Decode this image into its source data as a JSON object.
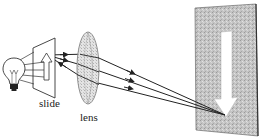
{
  "diagram": {
    "labels": {
      "slide": "slide",
      "lens": "lens"
    },
    "components": [
      {
        "name": "light-bulb",
        "icon": "light-bulb-icon"
      },
      {
        "name": "slide",
        "content": "upright arrow"
      },
      {
        "name": "lens",
        "type": "convex lens"
      },
      {
        "name": "screen",
        "content": "inverted arrow image"
      }
    ],
    "rays": {
      "count": 3,
      "from": "slide arrow tip",
      "through": "lens",
      "to": "screen arrow tip"
    },
    "colors": {
      "line": "#222222",
      "screen": "#b8b8b8",
      "lens": "#cfcfcf",
      "background": "#ffffff"
    }
  }
}
